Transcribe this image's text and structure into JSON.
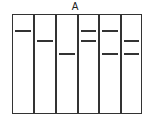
{
  "title": "A",
  "gel": {
    "lanes": 6,
    "frame": {
      "left": 12,
      "top": 14,
      "width": 130,
      "height": 100
    },
    "lane_edges": [
      12,
      34,
      56,
      78,
      99,
      121,
      142
    ],
    "band_rows": {
      "high": 30,
      "mid": 40,
      "low": 53
    },
    "bands": [
      {
        "lane": 1,
        "rows": [
          "high"
        ]
      },
      {
        "lane": 2,
        "rows": [
          "mid"
        ]
      },
      {
        "lane": 3,
        "rows": [
          "low"
        ]
      },
      {
        "lane": 4,
        "rows": [
          "high",
          "mid"
        ]
      },
      {
        "lane": 5,
        "rows": [
          "high",
          "low"
        ]
      },
      {
        "lane": 6,
        "rows": [
          "mid",
          "low"
        ]
      }
    ],
    "color": "#333333"
  }
}
